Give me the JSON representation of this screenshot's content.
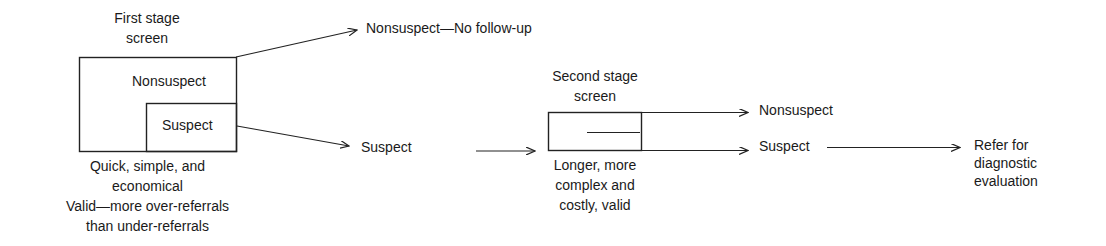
{
  "diagram": {
    "first_stage": {
      "title_line1": "First stage",
      "title_line2": "screen",
      "outer_label": "Nonsuspect",
      "inner_label": "Suspect",
      "caption_line1": "Quick, simple, and",
      "caption_line2": "economical",
      "caption_line3": "Valid—more over-referrals",
      "caption_line4": "than under-referrals"
    },
    "outcome_nonsuspect_1": "Nonsuspect—No follow-up",
    "outcome_suspect_1": "Suspect",
    "second_stage": {
      "title_line1": "Second stage",
      "title_line2": "screen",
      "caption_line1": "Longer, more",
      "caption_line2": "complex and",
      "caption_line3": "costly, valid"
    },
    "outcome_nonsuspect_2": "Nonsuspect",
    "outcome_suspect_2": "Suspect",
    "referral_line1": "Refer for",
    "referral_line2": "diagnostic",
    "referral_line3": "evaluation",
    "line_color": "#222222"
  }
}
